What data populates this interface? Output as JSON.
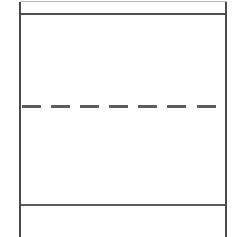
{
  "document": {
    "kind": "scanned-table-fragment",
    "width": 239,
    "height": 237,
    "background_color": "#ffffff",
    "empty_cell_text": "",
    "upper_cell_text": "",
    "lower_cell_text": "",
    "footer_cell_text": ""
  },
  "rules": {
    "vertical_left": {
      "name": "left-table-border",
      "color": "#4a4a4a",
      "x": 19,
      "y": 2,
      "thickness": 2,
      "length": 235
    },
    "vertical_right": {
      "name": "right-table-border",
      "color": "#4a4a4a",
      "x": 225,
      "y": 2,
      "thickness": 2,
      "length": 235
    },
    "top_hairline": {
      "name": "top-hairline-rule",
      "color": "#b9b9b9",
      "y": 1,
      "thickness": 1
    },
    "header_divider": {
      "name": "header-divider-rule",
      "color": "#4f4f4f",
      "y": 13,
      "thickness": 2
    },
    "footer_divider": {
      "name": "footer-divider-rule",
      "color": "#5a5a5a",
      "y": 204,
      "thickness": 2
    }
  },
  "dashed_separator": {
    "name": "center-dashed-rule",
    "color": "#5d5d5d",
    "y": 105,
    "thickness": 3,
    "start_x": 22,
    "end_x": 221,
    "dash_count": 7,
    "dashes": [
      {
        "x": 0,
        "width": 19
      },
      {
        "x": 29,
        "width": 19
      },
      {
        "x": 58,
        "width": 19
      },
      {
        "x": 87,
        "width": 19
      },
      {
        "x": 116,
        "width": 19
      },
      {
        "x": 145,
        "width": 19
      },
      {
        "x": 175,
        "width": 19
      }
    ]
  }
}
